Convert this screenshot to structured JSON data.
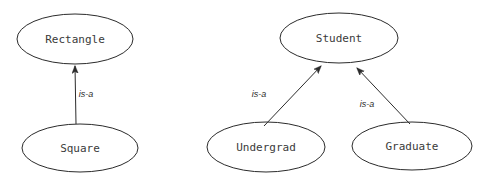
{
  "diagram": {
    "type": "is-a-hierarchy",
    "background_color": "#ffffff",
    "stroke_color": "#2b2b2b",
    "node_text_color": "#3a3a3a",
    "groups": [
      {
        "name": "shapes",
        "parent": {
          "label": "Rectangle",
          "cx": 75,
          "cy": 39,
          "rx": 58,
          "ry": 25
        },
        "children": [
          {
            "label": "Square",
            "cx": 80,
            "cy": 148,
            "rx": 58,
            "ry": 24
          }
        ],
        "edges": [
          {
            "label": "is-a",
            "from": "Square",
            "to": "Rectangle",
            "label_x": 86,
            "label_y": 95
          }
        ]
      },
      {
        "name": "students",
        "parent": {
          "label": "Student",
          "cx": 339,
          "cy": 38,
          "rx": 59,
          "ry": 25
        },
        "children": [
          {
            "label": "Undergrad",
            "cx": 266,
            "cy": 147,
            "rx": 59,
            "ry": 25
          },
          {
            "label": "Graduate",
            "cx": 412,
            "cy": 146,
            "rx": 60,
            "ry": 24
          }
        ],
        "edges": [
          {
            "label": "is-a",
            "from": "Undergrad",
            "to": "Student",
            "label_x": 259,
            "label_y": 95
          },
          {
            "label": "is-a",
            "from": "Graduate",
            "to": "Student",
            "label_x": 367,
            "label_y": 105
          }
        ]
      }
    ],
    "nodes": {
      "rectangle": "Rectangle",
      "square": "Square",
      "student": "Student",
      "undergrad": "Undergrad",
      "graduate": "Graduate"
    },
    "edge_labels": {
      "square_to_rectangle": "is-a",
      "undergrad_to_student": "is-a",
      "graduate_to_student": "is-a"
    }
  }
}
